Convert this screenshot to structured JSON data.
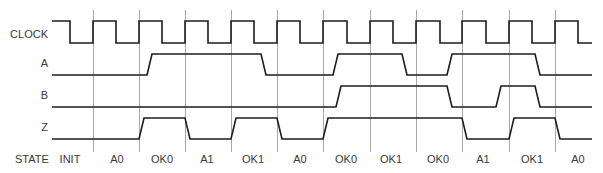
{
  "diagram": {
    "type": "timing-diagram",
    "grid_lines_x": [
      93,
      139,
      185,
      231,
      277,
      323,
      370,
      416,
      462,
      509,
      555
    ],
    "signals": [
      {
        "name": "CLOCK",
        "initial": 1,
        "slew": 0,
        "edges": [
          70,
          93,
          116,
          139,
          162,
          185,
          208,
          231,
          254,
          277,
          300,
          323,
          347,
          370,
          393,
          416,
          440,
          462,
          486,
          509,
          532,
          555,
          578
        ]
      },
      {
        "name": "A",
        "initial": 0,
        "slew": 5,
        "edges": [
          147,
          261,
          333,
          402,
          447,
          535
        ]
      },
      {
        "name": "B",
        "initial": 0,
        "slew": 5,
        "edges": [
          336,
          447,
          496,
          535
        ]
      },
      {
        "name": "Z",
        "initial": 0,
        "slew": 5,
        "edges": [
          139,
          185,
          231,
          277,
          323,
          462,
          509,
          555
        ]
      }
    ],
    "state_row": {
      "label": "STATE",
      "states": [
        "INIT",
        "A0",
        "OK0",
        "A1",
        "OK1",
        "A0",
        "OK0",
        "OK1",
        "OK0",
        "A1",
        "OK1",
        "A0"
      ]
    }
  }
}
